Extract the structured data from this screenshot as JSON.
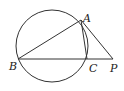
{
  "diagram": {
    "type": "geometry",
    "circle": {
      "cx": 52,
      "cy": 46,
      "r": 36
    },
    "points": {
      "A": {
        "label": "A",
        "x": 81,
        "y": 20
      },
      "B": {
        "label": "B",
        "x": 18,
        "y": 59
      },
      "C": {
        "label": "C",
        "x": 87,
        "y": 59
      },
      "P": {
        "label": "P",
        "x": 113,
        "y": 59
      }
    },
    "segments": [
      [
        "B",
        "A"
      ],
      [
        "A",
        "C"
      ],
      [
        "A",
        "P"
      ],
      [
        "B",
        "P"
      ]
    ],
    "stroke_color": "#333333"
  }
}
